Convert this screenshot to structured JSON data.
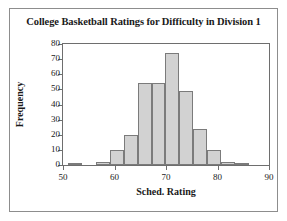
{
  "chart_data": {
    "type": "bar",
    "title": "College Basketball Ratings for Difficulty in Division 1",
    "xlabel": "Sched. Rating",
    "ylabel": "Frequency",
    "xlim": [
      50,
      90
    ],
    "ylim": [
      0,
      80
    ],
    "xticks": [
      50,
      60,
      70,
      80,
      90
    ],
    "yticks": [
      0,
      10,
      20,
      30,
      40,
      50,
      60,
      70,
      80
    ],
    "grid": false,
    "legend": null,
    "bin_width": 2.7,
    "bar_fill_color": "#d2d2d2",
    "bar_border_color": "#7b7b7b",
    "bins": [
      {
        "start": 51.0,
        "end": 53.7,
        "value": 1
      },
      {
        "start": 53.7,
        "end": 56.4,
        "value": 0
      },
      {
        "start": 56.4,
        "end": 59.1,
        "value": 2
      },
      {
        "start": 59.1,
        "end": 61.8,
        "value": 10
      },
      {
        "start": 61.8,
        "end": 64.5,
        "value": 20
      },
      {
        "start": 64.5,
        "end": 67.2,
        "value": 54
      },
      {
        "start": 67.2,
        "end": 69.9,
        "value": 54
      },
      {
        "start": 69.9,
        "end": 72.6,
        "value": 74
      },
      {
        "start": 72.6,
        "end": 75.3,
        "value": 49
      },
      {
        "start": 75.3,
        "end": 78.0,
        "value": 24
      },
      {
        "start": 78.0,
        "end": 80.7,
        "value": 10
      },
      {
        "start": 80.7,
        "end": 83.4,
        "value": 2
      },
      {
        "start": 83.4,
        "end": 86.1,
        "value": 1
      }
    ],
    "categories": [
      "51-53.7",
      "53.7-56.4",
      "56.4-59.1",
      "59.1-61.8",
      "61.8-64.5",
      "64.5-67.2",
      "67.2-69.9",
      "69.9-72.6",
      "72.6-75.3",
      "75.3-78",
      "78-80.7",
      "80.7-83.4",
      "83.4-86.1"
    ],
    "values": [
      1,
      0,
      2,
      10,
      20,
      54,
      54,
      74,
      49,
      24,
      10,
      2,
      1
    ]
  }
}
